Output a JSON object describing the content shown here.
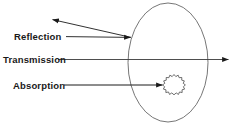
{
  "diagram": {
    "type": "optics-ray-diagram",
    "background_color": "#ffffff",
    "stroke_color": "#1a1a1a",
    "ellipse_stroke_color": "#555555",
    "labels": {
      "reflection": "Reflection",
      "transmission": "Transmission",
      "absorption": "Absorption"
    },
    "shapes": {
      "medium_ellipse": {
        "name": "medium-ellipse",
        "cx": 168,
        "cy": 62.5,
        "rx": 40,
        "ry": 59.5
      },
      "particle": {
        "name": "absorbing-particle-starburst",
        "cx": 174,
        "cy": 85,
        "outer_r": 10.5,
        "inner_r": 8.2,
        "points": 18
      }
    },
    "rays": {
      "reflection_incident": {
        "from_x": 66,
        "from_y": 36.5,
        "to_x": 131,
        "to_y": 37.5
      },
      "reflection_outgoing": {
        "from_x": 131,
        "from_y": 37.5,
        "to_x": 52,
        "to_y": 19.5
      },
      "transmission": {
        "from_x": 58,
        "from_y": 59.5,
        "to_x": 229,
        "to_y": 59.5
      },
      "absorption": {
        "from_x": 64,
        "from_y": 85,
        "to_x": 163,
        "to_y": 85
      }
    }
  }
}
